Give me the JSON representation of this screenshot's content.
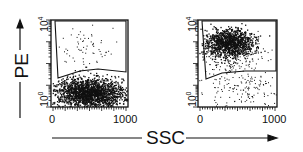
{
  "chart_data": [
    {
      "type": "scatter",
      "title": "",
      "xlabel": "SSC",
      "ylabel": "PE",
      "xlim": [
        0,
        1000
      ],
      "ylim_log": [
        1,
        10000
      ],
      "x_ticks": [
        "0",
        "1000"
      ],
      "y_ticks": [
        "10^0",
        "10^4"
      ],
      "gate": "polygon upper region (PE high)",
      "populations": [
        {
          "name": "main cluster",
          "location": "low PE, SSC ~200-900",
          "density": "very high"
        },
        {
          "name": "gated sparse",
          "location": "high PE, SSC ~200-800",
          "density": "sparse"
        }
      ]
    },
    {
      "type": "scatter",
      "title": "",
      "xlabel": "SSC",
      "ylabel": "PE",
      "xlim": [
        0,
        1000
      ],
      "ylim_log": [
        1,
        10000
      ],
      "x_ticks": [
        "0",
        "1000"
      ],
      "y_ticks": [
        "10^0",
        "10^4"
      ],
      "gate": "polygon upper region (PE high)",
      "populations": [
        {
          "name": "gated cluster",
          "location": "high PE, SSC ~150-600",
          "density": "very high"
        },
        {
          "name": "lower sparse",
          "location": "low PE, SSC ~200-800",
          "density": "sparse"
        }
      ]
    }
  ],
  "labels": {
    "y_axis": "PE",
    "x_axis": "SSC",
    "x_min": "0",
    "x_max": "1000",
    "y_min_base": "10",
    "y_min_exp": "0",
    "y_max_base": "10",
    "y_max_exp": "4"
  }
}
